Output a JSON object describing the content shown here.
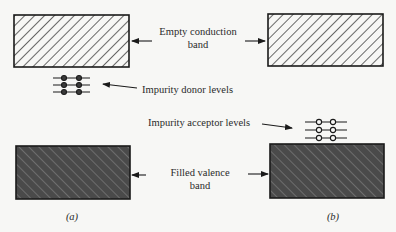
{
  "diagram": {
    "type": "energy-band-diagram",
    "panels": [
      {
        "id": "a",
        "caption": "(a)",
        "impurity": "donor",
        "impurity_level_count": 3,
        "dots_per_level": 2,
        "dot_style": "filled"
      },
      {
        "id": "b",
        "caption": "(b)",
        "impurity": "acceptor",
        "impurity_level_count": 3,
        "dots_per_level": 2,
        "dot_style": "open"
      }
    ],
    "labels": {
      "conduction_line1": "Empty conduction",
      "conduction_line2": "band",
      "donor": "Impurity donor levels",
      "acceptor": "Impurity acceptor levels",
      "valence_line1": "Filled valence",
      "valence_line2": "band"
    },
    "colors": {
      "background": "#f7f7f5",
      "outline": "#1a1a1a",
      "empty_band_fill": "#f7f7f5",
      "filled_band_fill": "#4a4a4a",
      "hatch_light": "#1a1a1a",
      "hatch_dark": "#8a8a8a"
    }
  }
}
